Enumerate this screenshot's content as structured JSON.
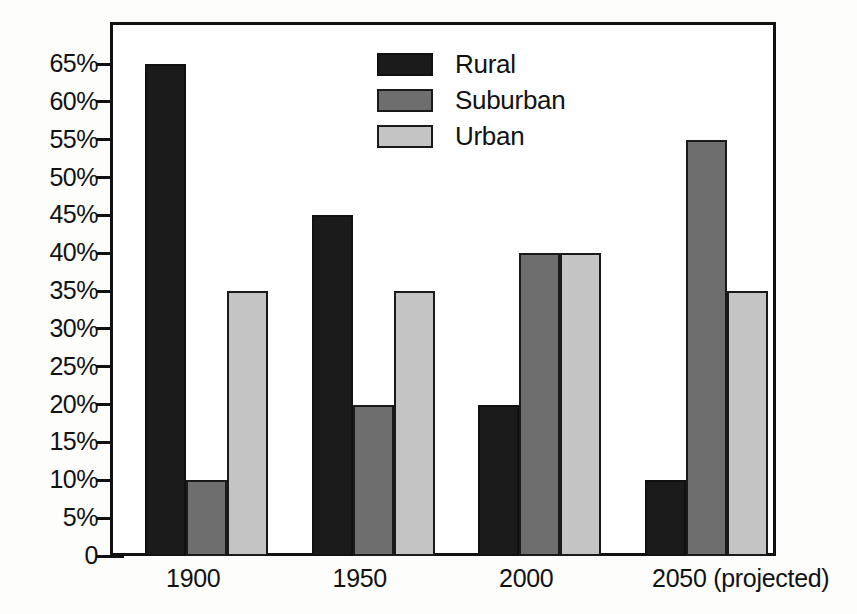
{
  "chart_data": {
    "type": "bar",
    "title": "",
    "subtitle": "",
    "xlabel": "",
    "ylabel": "",
    "categories": [
      "1900",
      "1950",
      "2000",
      "2050 (projected)"
    ],
    "series": [
      {
        "name": "Rural",
        "color": "#1b1b1b",
        "values": [
          65,
          45,
          20,
          10
        ]
      },
      {
        "name": "Suburban",
        "color": "#6e6e6e",
        "values": [
          10,
          20,
          40,
          55
        ]
      },
      {
        "name": "Urban",
        "color": "#c4c4c4",
        "values": [
          35,
          35,
          40,
          35
        ]
      }
    ],
    "ylim": [
      0,
      65
    ],
    "ytick_values": [
      0,
      5,
      10,
      15,
      20,
      25,
      30,
      35,
      40,
      45,
      50,
      55,
      60,
      65
    ],
    "ytick_labels": [
      "0",
      "5%",
      "10%",
      "15%",
      "20%",
      "25%",
      "30%",
      "35%",
      "40%",
      "45%",
      "50%",
      "55%",
      "60%",
      "65%"
    ],
    "grid": false,
    "legend_position": "top-center",
    "units": "percent"
  },
  "legend": {
    "entries": [
      {
        "label": "Rural",
        "swatch": "rural"
      },
      {
        "label": "Suburban",
        "swatch": "suburban"
      },
      {
        "label": "Urban",
        "swatch": "urban"
      }
    ]
  }
}
